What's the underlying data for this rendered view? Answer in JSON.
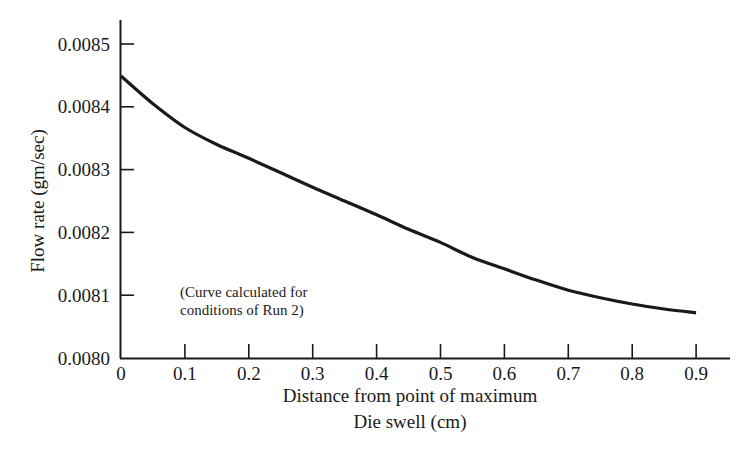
{
  "chart_data": {
    "type": "line",
    "title": "",
    "xlabel": "Distance from point of maximum Die swell (cm)",
    "xlabel_lines": [
      "Distance from point of maximum",
      "Die swell (cm)"
    ],
    "ylabel": "Flow rate (gm/sec)",
    "xlim": [
      0,
      0.95
    ],
    "ylim": [
      0.008,
      0.00855
    ],
    "x_ticks": [
      0,
      0.1,
      0.2,
      0.3,
      0.4,
      0.5,
      0.6,
      0.7,
      0.8,
      0.9
    ],
    "x_tick_labels": [
      "0",
      "0.1",
      "0.2",
      "0.3",
      "0.4",
      "0.5",
      "0.6",
      "0.7",
      "0.8",
      "0.9"
    ],
    "y_ticks": [
      0.008,
      0.0081,
      0.0082,
      0.0083,
      0.0084,
      0.0085
    ],
    "y_tick_labels": [
      "0.0080",
      "0.0081",
      "0.0082",
      "0.0083",
      "0.0084",
      "0.0085"
    ],
    "grid": false,
    "legend": null,
    "annotation": {
      "lines": [
        "(Curve calculated for",
        "conditions of Run 2)"
      ],
      "x": 0.09,
      "y": 0.00811
    },
    "series": [
      {
        "name": "Flow rate",
        "color": "#1a1a1a",
        "x": [
          0,
          0.05,
          0.1,
          0.15,
          0.2,
          0.25,
          0.3,
          0.35,
          0.4,
          0.45,
          0.5,
          0.55,
          0.6,
          0.65,
          0.7,
          0.75,
          0.8,
          0.85,
          0.9
        ],
        "y": [
          0.008449,
          0.008405,
          0.008367,
          0.00834,
          0.008318,
          0.008295,
          0.008272,
          0.00825,
          0.008228,
          0.008205,
          0.008184,
          0.00816,
          0.008142,
          0.008124,
          0.008108,
          0.008096,
          0.008086,
          0.008078,
          0.008072
        ]
      }
    ]
  }
}
